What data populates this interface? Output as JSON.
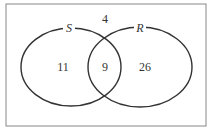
{
  "diagram": {
    "type": "venn",
    "sets": [
      {
        "name": "S",
        "only_count": "11"
      },
      {
        "name": "R",
        "only_count": "26"
      }
    ],
    "intersection": "9",
    "outside": "4"
  }
}
